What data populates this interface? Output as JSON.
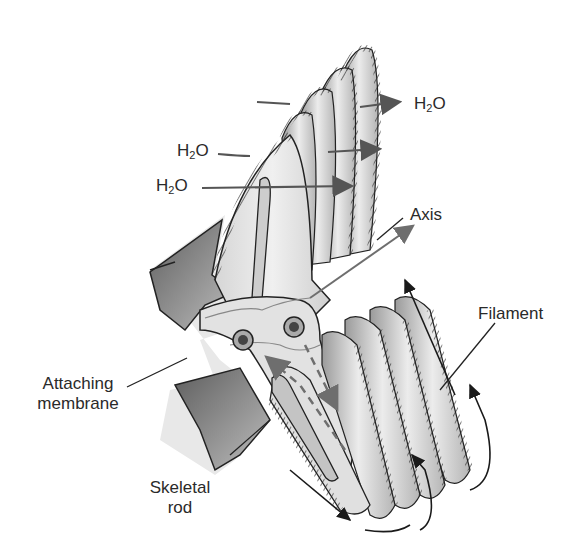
{
  "diagram": {
    "type": "anatomical illustration",
    "colors": {
      "background": "#ffffff",
      "tissue_light": "#e6e6e6",
      "tissue_mid": "#c8c8c8",
      "tissue_dark": "#7a7a7a",
      "outline": "#1e1e1e",
      "water_arrow": "#555555",
      "flow_arrow": "#1a1a1a",
      "dashed_flow": "#6e6e6e",
      "label_text": "#2a2a2a"
    },
    "labels": {
      "h2o_right": {
        "main": "H",
        "sub": "2",
        "tail": "O"
      },
      "h2o_left_upper": {
        "main": "H",
        "sub": "2",
        "tail": "O"
      },
      "h2o_left_lower": {
        "main": "H",
        "sub": "2",
        "tail": "O"
      },
      "axis": "Axis",
      "filament": "Filament",
      "attaching_membrane_line1": "Attaching",
      "attaching_membrane_line2": "membrane",
      "skeletal_rod_line1": "Skeletal",
      "skeletal_rod_line2": "rod"
    }
  }
}
